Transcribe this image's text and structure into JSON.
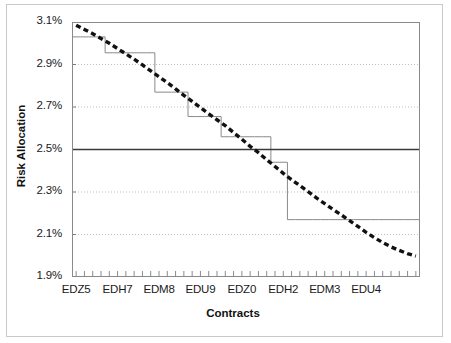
{
  "chart_data": {
    "type": "line",
    "title": "",
    "xlabel": "Contracts",
    "ylabel": "Risk Allocation",
    "ylim": [
      1.9,
      3.1
    ],
    "ytick_labels": [
      "3.1%",
      "2.9%",
      "2.7%",
      "2.5%",
      "2.3%",
      "2.1%",
      "1.9%"
    ],
    "ytick_values": [
      3.1,
      2.9,
      2.7,
      2.5,
      2.3,
      2.1,
      1.9
    ],
    "xtick_labels": [
      "EDZ5",
      "EDH7",
      "EDM8",
      "EDU9",
      "EDZ0",
      "EDH2",
      "EDM3",
      "EDU4"
    ],
    "xtick_positions": [
      1,
      6,
      11,
      16,
      21,
      26,
      31,
      36
    ],
    "minor_xticks": 42,
    "grid": "horizontal-dotted",
    "legend": "none",
    "x": [
      1,
      2,
      3,
      4,
      5,
      6,
      7,
      8,
      9,
      10,
      11,
      12,
      13,
      14,
      15,
      16,
      17,
      18,
      19,
      20,
      21,
      22,
      23,
      24,
      25,
      26,
      27,
      28,
      29,
      30,
      31,
      32,
      33,
      34,
      35,
      36,
      37,
      38,
      39,
      40,
      41,
      42
    ],
    "series": [
      {
        "name": "smooth-declining-dashed",
        "style": "thick-dashed-black",
        "color": "#111111",
        "values": [
          3.085,
          3.065,
          3.045,
          3.022,
          3.0,
          2.975,
          2.95,
          2.925,
          2.898,
          2.87,
          2.842,
          2.815,
          2.785,
          2.755,
          2.726,
          2.697,
          2.668,
          2.64,
          2.612,
          2.58,
          2.548,
          2.515,
          2.485,
          2.452,
          2.42,
          2.388,
          2.358,
          2.33,
          2.302,
          2.272,
          2.245,
          2.218,
          2.192,
          2.165,
          2.138,
          2.11,
          2.085,
          2.062,
          2.042,
          2.025,
          2.01,
          1.998
        ]
      },
      {
        "name": "step-allocation",
        "style": "thin-solid-gray-step",
        "color": "#8a8a8a",
        "values": [
          3.03,
          3.03,
          3.03,
          3.03,
          2.955,
          2.955,
          2.955,
          2.955,
          2.955,
          2.955,
          2.77,
          2.77,
          2.77,
          2.77,
          2.655,
          2.655,
          2.655,
          2.655,
          2.56,
          2.56,
          2.56,
          2.56,
          2.56,
          2.56,
          2.44,
          2.44,
          2.17,
          2.17,
          2.17,
          2.17,
          2.17,
          2.17,
          2.17,
          2.17,
          2.17,
          2.17,
          2.17,
          2.17,
          2.17,
          2.17,
          2.17,
          2.17
        ]
      },
      {
        "name": "target-level",
        "style": "solid-dark-horizontal",
        "color": "#3a3a3a",
        "constant": 2.5
      }
    ]
  },
  "axis": {
    "y_title": "Risk Allocation",
    "x_title": "Contracts"
  }
}
